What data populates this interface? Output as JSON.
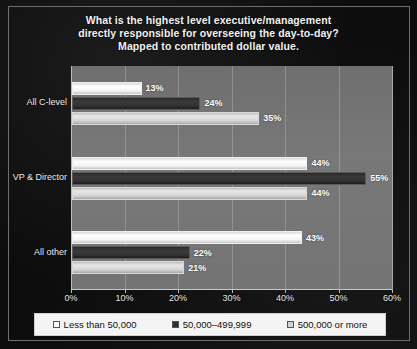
{
  "chart_data": {
    "type": "bar",
    "orientation": "horizontal",
    "title": "What is the highest level executive/management directly responsible for overseeing the day-to-day? Mapped to contributed dollar value.",
    "title_lines": [
      "What is the highest level executive/management",
      "directly responsible for overseeing the day-to-day?",
      "Mapped to contributed dollar value."
    ],
    "categories": [
      "All C-level",
      "VP & Director",
      "All other"
    ],
    "series": [
      {
        "name": "Less than 50,000",
        "values": [
          13,
          44,
          43
        ],
        "color": "#fbfbfb"
      },
      {
        "name": "50,000–499,999",
        "values": [
          24,
          55,
          22
        ],
        "color": "#303030"
      },
      {
        "name": "500,000 or more",
        "values": [
          35,
          44,
          21
        ],
        "color": "#d2d2d2"
      }
    ],
    "value_labels": [
      [
        "13%",
        "24%",
        "35%"
      ],
      [
        "44%",
        "55%",
        "44%"
      ],
      [
        "43%",
        "22%",
        "21%"
      ]
    ],
    "xlabel": "",
    "ylabel": "",
    "xlim": [
      0,
      60
    ],
    "xtick_values": [
      0,
      10,
      20,
      30,
      40,
      50,
      60
    ],
    "xtick_labels": [
      "0%",
      "10%",
      "20%",
      "30%",
      "40%",
      "50%",
      "60%"
    ],
    "grid": true,
    "grid_axis": "x",
    "legend_position": "bottom",
    "legend_entries": [
      "Less than 50,000",
      "50,000–499,999",
      "500,000 or more"
    ],
    "background_color": "#0d0d0d",
    "plot_background_color": "#747474",
    "title_color": "#f2f2f2"
  }
}
